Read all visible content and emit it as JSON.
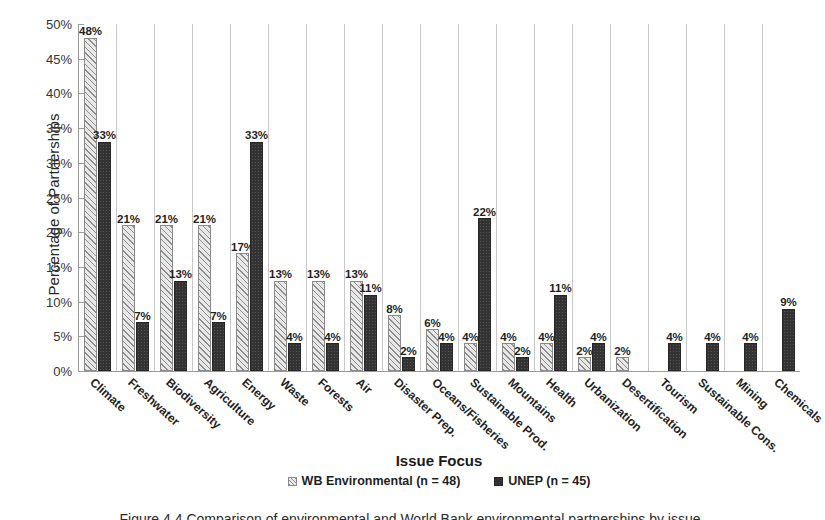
{
  "chart_data": {
    "type": "bar",
    "title": "",
    "xlabel": "Issue Focus",
    "ylabel": "Percentage of Partnerships",
    "ylim": [
      0,
      50
    ],
    "ytick_labels": [
      "0%",
      "5%",
      "10%",
      "15%",
      "20%",
      "25%",
      "30%",
      "35%",
      "40%",
      "45%",
      "50%"
    ],
    "ytick_values": [
      0,
      5,
      10,
      15,
      20,
      25,
      30,
      35,
      40,
      45,
      50
    ],
    "grid": false,
    "legend_position": "bottom",
    "categories": [
      "Climate",
      "Freshwater",
      "Biodiversity",
      "Agriculture",
      "Energy",
      "Waste",
      "Forests",
      "Air",
      "Disaster Prep.",
      "Oceans/Fisheries",
      "Sustainable Prod.",
      "Mountains",
      "Health",
      "Urbanization",
      "Desertification",
      "Tourism",
      "Sustainable Cons.",
      "Mining",
      "Chemicals"
    ],
    "series": [
      {
        "name": "WB Environmental (n = 48)",
        "style": "hatched",
        "values": [
          48,
          21,
          21,
          21,
          17,
          13,
          13,
          13,
          8,
          6,
          4,
          4,
          4,
          2,
          2,
          null,
          null,
          null,
          null
        ],
        "labels": [
          "48%",
          "21%",
          "21%",
          "21%",
          "17%",
          "13%",
          "13%",
          "13%",
          "8%",
          "6%",
          "4%",
          "4%",
          "4%",
          "2%",
          "2%",
          "",
          "",
          "",
          ""
        ]
      },
      {
        "name": "UNEP (n = 45)",
        "style": "solid-dark",
        "values": [
          33,
          7,
          13,
          7,
          33,
          4,
          4,
          11,
          2,
          4,
          22,
          2,
          11,
          4,
          null,
          4,
          4,
          4,
          9
        ],
        "labels": [
          "33%",
          "7%",
          "13%",
          "7%",
          "33%",
          "4%",
          "4%",
          "11%",
          "2%",
          "4%",
          "22%",
          "2%",
          "11%",
          "4%",
          "",
          "4%",
          "4%",
          "4%",
          "9%"
        ]
      }
    ]
  },
  "legend": {
    "items": [
      {
        "label": "WB Environmental (n = 48)",
        "swatch": "hatched-square-icon"
      },
      {
        "label": "UNEP (n = 45)",
        "swatch": "dark-square-icon"
      }
    ]
  },
  "colors": {
    "wb_fill": "#e8e8e8",
    "wb_hatch": "#8d8d8d",
    "unep_fill": "#333333",
    "axis": "#9a9a9a",
    "text": "#1a1a1a"
  },
  "caption": {
    "clipped_line": "Figure 4.4 Comparison of environmental and World Bank environmental partnerships by issue"
  }
}
